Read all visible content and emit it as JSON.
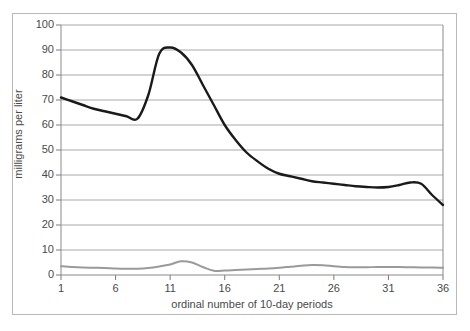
{
  "chart_data": {
    "type": "line",
    "title": "",
    "xlabel": "ordinal number of 10-day periods",
    "ylabel": "milligrams per liter",
    "xlim": [
      1,
      36
    ],
    "ylim": [
      0,
      100
    ],
    "xticks": [
      1,
      6,
      11,
      16,
      21,
      26,
      31,
      36
    ],
    "yticks": [
      0,
      10,
      20,
      30,
      40,
      50,
      60,
      70,
      80,
      90,
      100
    ],
    "grid": true,
    "grid_color": "#a8a8a8",
    "legend": "none",
    "x": [
      1,
      2,
      3,
      4,
      5,
      6,
      7,
      8,
      9,
      10,
      11,
      12,
      13,
      14,
      15,
      16,
      17,
      18,
      19,
      20,
      21,
      22,
      23,
      24,
      25,
      26,
      27,
      28,
      29,
      30,
      31,
      32,
      33,
      34,
      35,
      36
    ],
    "series": [
      {
        "name": "dark-series",
        "color": "#1a1a1a",
        "width": 2.4,
        "values": [
          71,
          69.5,
          68,
          66.5,
          65.5,
          64.5,
          63.5,
          62.5,
          72,
          88.5,
          91,
          89,
          84,
          76,
          68,
          60,
          54,
          49,
          45.5,
          42.5,
          40.5,
          39.5,
          38.5,
          37.5,
          37,
          36.5,
          36,
          35.5,
          35.2,
          35,
          35.2,
          36,
          37,
          36.5,
          32,
          28
        ]
      },
      {
        "name": "gray-series",
        "color": "#9a9a9a",
        "width": 2.0,
        "values": [
          3.5,
          3.2,
          3.0,
          2.9,
          2.8,
          2.6,
          2.5,
          2.5,
          2.8,
          3.4,
          4.2,
          5.5,
          5.0,
          3.2,
          1.7,
          1.8,
          2.0,
          2.2,
          2.4,
          2.6,
          2.9,
          3.3,
          3.7,
          4.0,
          3.9,
          3.5,
          3.2,
          3.1,
          3.1,
          3.2,
          3.2,
          3.2,
          3.1,
          3.0,
          3.0,
          2.9
        ]
      }
    ]
  }
}
